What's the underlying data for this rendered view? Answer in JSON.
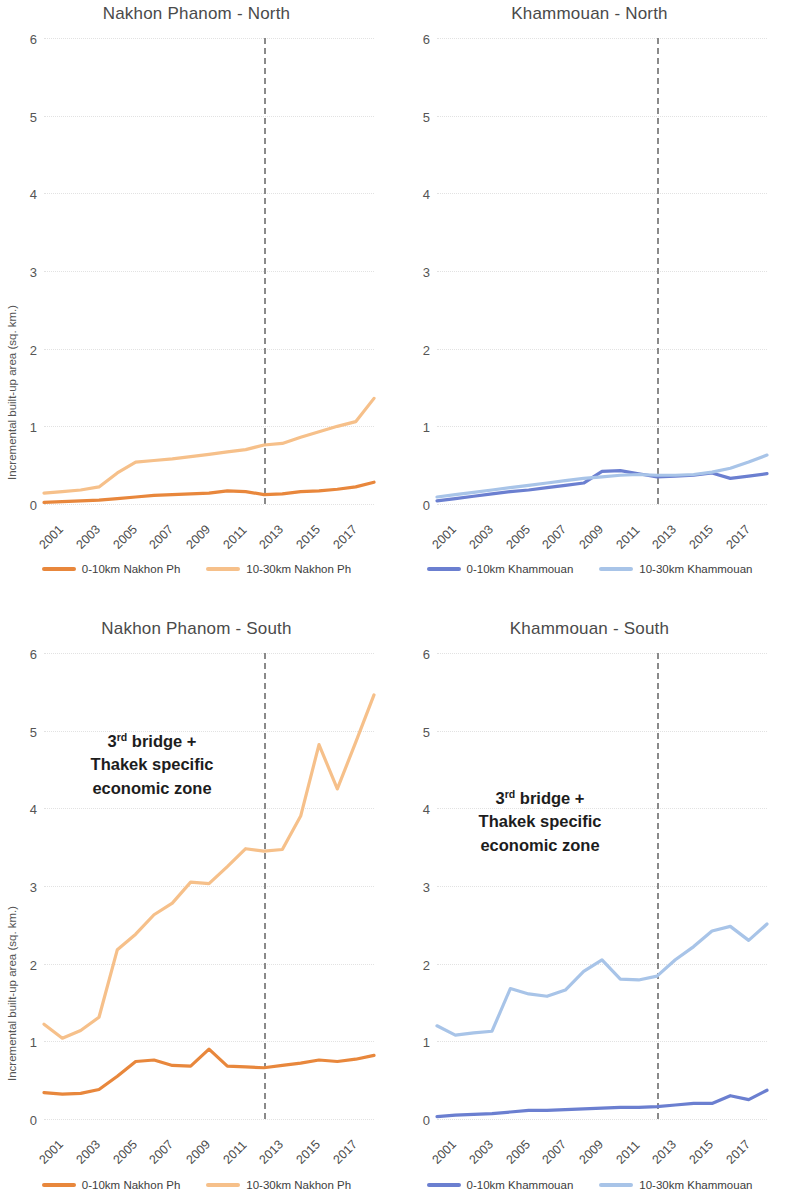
{
  "figure": {
    "y_axis_label": "Incremental built-up area (sq. km.)",
    "annotation_line1_prefix": "3",
    "annotation_line1_sup": "rd",
    "annotation_line1_suffix": " bridge +",
    "annotation_line2": "Thakek specific",
    "annotation_line3": "economic zone",
    "colors": {
      "dark_orange": "#E8873C",
      "light_orange": "#F6C08A",
      "dark_blue": "#6B7FD0",
      "light_blue": "#A8C4E8",
      "gridline": "#E2E2E2",
      "reference_line": "#8A8A8A",
      "title_text": "#4A4A4A"
    }
  },
  "chart_data": [
    {
      "type": "line",
      "title": "Nakhon Phanom - North",
      "xlabel": "",
      "ylabel": "Incremental built-up area (sq. km.)",
      "ylim": [
        0,
        6
      ],
      "yticks": [
        0,
        1,
        2,
        3,
        4,
        5,
        6
      ],
      "grid": true,
      "legend_position": "bottom",
      "x": [
        2000,
        2001,
        2002,
        2003,
        2004,
        2005,
        2006,
        2007,
        2008,
        2009,
        2010,
        2011,
        2012,
        2013,
        2014,
        2015,
        2016,
        2017,
        2018
      ],
      "xtick_labels": [
        "2001",
        "2003",
        "2005",
        "2007",
        "2009",
        "2011",
        "2013",
        "2015",
        "2017"
      ],
      "annotations": [
        {
          "type": "vline",
          "x": 2012,
          "style": "dashed"
        }
      ],
      "series": [
        {
          "name": "0-10km Nakhon Ph",
          "color": "#E8873C",
          "values": [
            0.02,
            0.03,
            0.04,
            0.05,
            0.07,
            0.09,
            0.11,
            0.12,
            0.13,
            0.14,
            0.17,
            0.16,
            0.12,
            0.13,
            0.16,
            0.17,
            0.19,
            0.22,
            0.28
          ]
        },
        {
          "name": "10-30km Nakhon Ph",
          "color": "#F6C08A",
          "values": [
            0.14,
            0.16,
            0.18,
            0.22,
            0.4,
            0.54,
            0.56,
            0.58,
            0.61,
            0.64,
            0.67,
            0.7,
            0.76,
            0.78,
            0.86,
            0.93,
            1.0,
            1.06,
            1.36
          ]
        }
      ]
    },
    {
      "type": "line",
      "title": "Khammouan - North",
      "xlabel": "",
      "ylabel": "",
      "ylim": [
        0,
        6
      ],
      "yticks": [
        0,
        1,
        2,
        3,
        4,
        5,
        6
      ],
      "grid": true,
      "legend_position": "bottom",
      "x": [
        2000,
        2001,
        2002,
        2003,
        2004,
        2005,
        2006,
        2007,
        2008,
        2009,
        2010,
        2011,
        2012,
        2013,
        2014,
        2015,
        2016,
        2017,
        2018
      ],
      "xtick_labels": [
        "2001",
        "2003",
        "2005",
        "2007",
        "2009",
        "2011",
        "2013",
        "2015",
        "2017"
      ],
      "annotations": [
        {
          "type": "vline",
          "x": 2012,
          "style": "dashed"
        }
      ],
      "series": [
        {
          "name": "0-10km Khammouan",
          "color": "#6B7FD0",
          "values": [
            0.04,
            0.07,
            0.1,
            0.13,
            0.16,
            0.18,
            0.21,
            0.24,
            0.27,
            0.42,
            0.43,
            0.39,
            0.35,
            0.36,
            0.37,
            0.4,
            0.33,
            0.36,
            0.39
          ]
        },
        {
          "name": "10-30km Khammouan",
          "color": "#A8C4E8",
          "values": [
            0.09,
            0.12,
            0.15,
            0.18,
            0.21,
            0.24,
            0.27,
            0.3,
            0.33,
            0.35,
            0.37,
            0.38,
            0.37,
            0.37,
            0.38,
            0.41,
            0.46,
            0.54,
            0.63
          ]
        }
      ]
    },
    {
      "type": "line",
      "title": "Nakhon Phanom - South",
      "xlabel": "",
      "ylabel": "Incremental built-up area (sq. km.)",
      "ylim": [
        0,
        6
      ],
      "yticks": [
        0,
        1,
        2,
        3,
        4,
        5,
        6
      ],
      "grid": true,
      "legend_position": "bottom",
      "x": [
        2000,
        2001,
        2002,
        2003,
        2004,
        2005,
        2006,
        2007,
        2008,
        2009,
        2010,
        2011,
        2012,
        2013,
        2014,
        2015,
        2016,
        2017,
        2018
      ],
      "xtick_labels": [
        "2001",
        "2003",
        "2005",
        "2007",
        "2009",
        "2011",
        "2013",
        "2015",
        "2017"
      ],
      "annotations": [
        {
          "type": "vline",
          "x": 2012,
          "style": "dashed"
        },
        {
          "type": "text",
          "text": "3rd bridge + Thakek specific economic zone"
        }
      ],
      "series": [
        {
          "name": "0-10km Nakhon Ph",
          "color": "#E8873C",
          "values": [
            0.34,
            0.32,
            0.33,
            0.38,
            0.55,
            0.74,
            0.76,
            0.69,
            0.68,
            0.9,
            0.68,
            0.67,
            0.66,
            0.69,
            0.72,
            0.76,
            0.74,
            0.77,
            0.82
          ]
        },
        {
          "name": "10-30km Nakhon Ph",
          "color": "#F6C08A",
          "values": [
            1.22,
            1.04,
            1.14,
            1.31,
            2.18,
            2.38,
            2.63,
            2.78,
            3.05,
            3.03,
            3.25,
            3.48,
            3.45,
            3.47,
            3.9,
            4.82,
            4.25,
            4.85,
            5.46
          ]
        }
      ]
    },
    {
      "type": "line",
      "title": "Khammouan - South",
      "xlabel": "",
      "ylabel": "",
      "ylim": [
        0,
        6
      ],
      "yticks": [
        0,
        1,
        2,
        3,
        4,
        5,
        6
      ],
      "grid": true,
      "legend_position": "bottom",
      "x": [
        2000,
        2001,
        2002,
        2003,
        2004,
        2005,
        2006,
        2007,
        2008,
        2009,
        2010,
        2011,
        2012,
        2013,
        2014,
        2015,
        2016,
        2017,
        2018
      ],
      "xtick_labels": [
        "2001",
        "2003",
        "2005",
        "2007",
        "2009",
        "2011",
        "2013",
        "2015",
        "2017"
      ],
      "annotations": [
        {
          "type": "vline",
          "x": 2012,
          "style": "dashed"
        },
        {
          "type": "text",
          "text": "3rd bridge + Thakek specific economic zone"
        }
      ],
      "series": [
        {
          "name": "0-10km Khammouan",
          "color": "#6B7FD0",
          "values": [
            0.03,
            0.05,
            0.06,
            0.07,
            0.09,
            0.11,
            0.11,
            0.12,
            0.13,
            0.14,
            0.15,
            0.15,
            0.16,
            0.18,
            0.2,
            0.2,
            0.3,
            0.25,
            0.37
          ]
        },
        {
          "name": "10-30km Khammouan",
          "color": "#A8C4E8",
          "values": [
            1.2,
            1.08,
            1.11,
            1.13,
            1.68,
            1.61,
            1.58,
            1.66,
            1.9,
            2.05,
            1.8,
            1.79,
            1.84,
            2.05,
            2.22,
            2.42,
            2.48,
            2.3,
            2.51
          ]
        }
      ]
    }
  ],
  "panels": [
    {
      "title": "Nakhon Phanom - North",
      "legend": [
        {
          "label": "0-10km Nakhon Ph",
          "color": "#E8873C"
        },
        {
          "label": "10-30km Nakhon Ph",
          "color": "#F6C08A"
        }
      ]
    },
    {
      "title": "Khammouan - North",
      "legend": [
        {
          "label": "0-10km Khammouan",
          "color": "#6B7FD0"
        },
        {
          "label": "10-30km Khammouan",
          "color": "#A8C4E8"
        }
      ]
    },
    {
      "title": "Nakhon Phanom - South",
      "legend": [
        {
          "label": "0-10km Nakhon Ph",
          "color": "#E8873C"
        },
        {
          "label": "10-30km Nakhon Ph",
          "color": "#F6C08A"
        }
      ]
    },
    {
      "title": "Khammouan - South",
      "legend": [
        {
          "label": "0-10km Khammouan",
          "color": "#6B7FD0"
        },
        {
          "label": "10-30km Khammouan",
          "color": "#A8C4E8"
        }
      ]
    }
  ]
}
